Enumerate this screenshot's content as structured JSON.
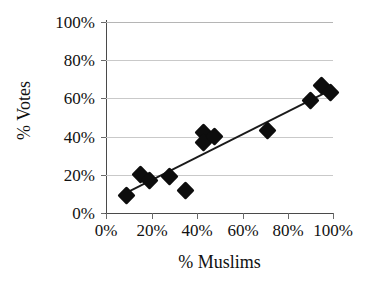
{
  "chart_data": {
    "type": "scatter",
    "title": "",
    "xlabel": "% Muslims",
    "ylabel": "% Votes",
    "xlim": [
      0,
      100
    ],
    "ylim": [
      0,
      100
    ],
    "grid": true,
    "legend": null,
    "x_ticks": [
      "0%",
      "20%",
      "40%",
      "60%",
      "80%",
      "100%"
    ],
    "x_tick_values": [
      0,
      20,
      40,
      60,
      80,
      100
    ],
    "y_ticks": [
      "0%",
      "20%",
      "40%",
      "60%",
      "80%",
      "100%"
    ],
    "y_tick_values": [
      0,
      20,
      40,
      60,
      80,
      100
    ],
    "marker": "filled-diamond",
    "marker_color": "#0d0d0d",
    "points": [
      {
        "x": 9,
        "y": 9
      },
      {
        "x": 15,
        "y": 20
      },
      {
        "x": 19,
        "y": 17
      },
      {
        "x": 28,
        "y": 19
      },
      {
        "x": 35,
        "y": 12
      },
      {
        "x": 43,
        "y": 42
      },
      {
        "x": 43,
        "y": 37
      },
      {
        "x": 48,
        "y": 40
      },
      {
        "x": 71,
        "y": 43
      },
      {
        "x": 90,
        "y": 59
      },
      {
        "x": 95,
        "y": 67
      },
      {
        "x": 99,
        "y": 63
      }
    ],
    "trendline": {
      "type": "linear",
      "color": "#1a1a1a",
      "x_start": 8,
      "y_start": 10,
      "x_end": 100,
      "y_end": 65
    }
  }
}
